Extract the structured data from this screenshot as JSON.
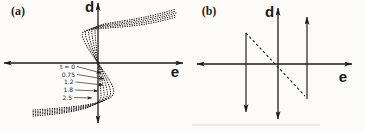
{
  "figure": {
    "bg": "#fcfbf8",
    "ink": "#1c1c1c",
    "artifact_color": "#d9d7d2"
  },
  "panels": {
    "a": {
      "label": "(a)",
      "x_axis_label": "e",
      "y_axis_label": "d",
      "label_px": [
        18,
        15
      ],
      "x_label_px": [
        175,
        77
      ],
      "y_label_px": [
        89.5,
        11.5
      ],
      "x_axis_px": {
        "y": 63,
        "x1": 4,
        "x2": 183
      },
      "y_axis_px": {
        "x": 98,
        "y1": 123,
        "y2": 3
      },
      "origin_px": [
        98,
        63
      ]
    },
    "b": {
      "label": "(b)",
      "x_axis_label": "e",
      "y_axis_label": "d",
      "label_px": [
        209,
        15
      ],
      "x_label_px": [
        343,
        82
      ],
      "y_label_px": [
        269.5,
        17
      ],
      "x_axis_px": {
        "y": 64,
        "x1": 197,
        "x2": 352
      },
      "y_axis_px": {
        "x": 278,
        "y1": 119,
        "y2": 8
      }
    }
  },
  "chart_data": [
    {
      "type": "line",
      "panel": "a",
      "title": "(a)",
      "xlabel": "e",
      "ylabel": "d",
      "grid": false,
      "ticks": "none (qualitative sketch, axes through origin with arrows)",
      "line_style": "dotted",
      "description": "Family of point-symmetric S-shaped curves d(e) that overturn (become multivalued) as time t increases; each curve runs from a lower-left tail, folds back right of the d-axis below the e-axis, passes steeply through the origin with negative middle-branch slope, folds left of the d-axis above the e-axis, then flattens into an upper-right tail. Coordinates in screenshot pixels; origin at [98,63].",
      "origin_px": [
        98,
        63
      ],
      "series": [
        {
          "name": "t = 0",
          "fold_e_px": 3.0,
          "fold_d_px": 33,
          "tail_lo_px": [
            33,
            116.0
          ],
          "tail_hi_px": [
            176,
            9.0
          ]
        },
        {
          "name": "0.75",
          "fold_e_px": 6.2,
          "fold_d_px": 32,
          "tail_lo_px": [
            33,
            114.5
          ],
          "tail_hi_px": [
            176,
            11.0
          ]
        },
        {
          "name": "1.2",
          "fold_e_px": 9.4,
          "fold_d_px": 31,
          "tail_lo_px": [
            33,
            113.0
          ],
          "tail_hi_px": [
            176,
            13.0
          ]
        },
        {
          "name": "1.8",
          "fold_e_px": 12.6,
          "fold_d_px": 30,
          "tail_lo_px": [
            33,
            111.5
          ],
          "tail_hi_px": [
            176,
            15.0
          ]
        },
        {
          "name": "2.5",
          "fold_e_px": 15.8,
          "fold_d_px": 29,
          "tail_lo_px": [
            33,
            110.0
          ],
          "tail_hi_px": [
            176,
            17.0
          ]
        }
      ],
      "annotations": [
        {
          "text": "t = 0",
          "label_px": [
            75,
            68.5
          ],
          "from_px": [
            77,
            66.5
          ],
          "tip_px": [
            101,
            73
          ]
        },
        {
          "text": "0.75",
          "label_px": [
            75,
            76.5
          ],
          "from_px": [
            77,
            74.5
          ],
          "tip_px": [
            104,
            79
          ]
        },
        {
          "text": "1.2",
          "label_px": [
            73.5,
            84
          ],
          "from_px": [
            75.5,
            82
          ],
          "tip_px": [
            103,
            85
          ]
        },
        {
          "text": "1.8",
          "label_px": [
            73,
            92
          ],
          "from_px": [
            75,
            90
          ],
          "tip_px": [
            98,
            91
          ]
        },
        {
          "text": "2.5",
          "label_px": [
            72,
            99.5
          ],
          "from_px": [
            74,
            97.5
          ],
          "tip_px": [
            92,
            98
          ]
        }
      ]
    },
    {
      "type": "line",
      "panel": "b",
      "title": "(b)",
      "xlabel": "e",
      "ylabel": "d",
      "grid": false,
      "ticks": "none (qualitative sketch, axes through origin with arrows)",
      "description": "Long-time limit of panel (a): dashed unstable middle branch with negative slope through the origin, flanked by two vertical jump lines — left line ends in a downward arrow, right line ends in an upward arrow. Coordinates in screenshot pixels.",
      "series": [
        {
          "name": "unstable middle branch",
          "style": "dashed",
          "from_px": [
            246,
            33
          ],
          "to_px": [
            305,
            96
          ]
        },
        {
          "name": "left jump",
          "style": "arrow",
          "from_px": [
            246,
            33
          ],
          "to_px": [
            246,
            112
          ]
        },
        {
          "name": "right jump",
          "style": "arrow",
          "from_px": [
            307,
            99
          ],
          "to_px": [
            307,
            17
          ]
        }
      ]
    }
  ],
  "artifacts": [
    {
      "name": "scan-streak",
      "x": 192,
      "y": 124,
      "w": 128,
      "h": 1.8,
      "opacity": 0.55
    }
  ]
}
